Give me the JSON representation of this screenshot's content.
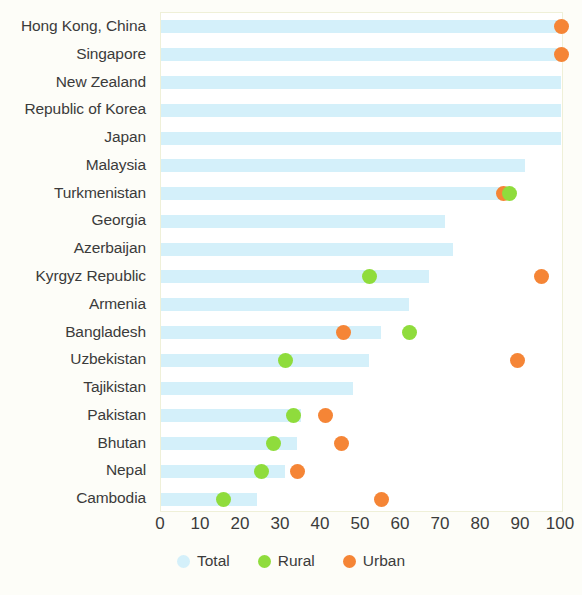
{
  "chart_data": {
    "type": "bar",
    "title": "",
    "subtitle": "",
    "xlabel": "",
    "ylabel": "",
    "xlim": [
      0,
      100
    ],
    "xticks": [
      0,
      10,
      20,
      30,
      40,
      50,
      60,
      70,
      80,
      90,
      100
    ],
    "grid": false,
    "orientation": "horizontal",
    "legend_position": "bottom",
    "categories": [
      "Hong Kong, China",
      "Singapore",
      "New Zealand",
      "Republic of Korea",
      "Japan",
      "Malaysia",
      "Turkmenistan",
      "Georgia",
      "Azerbaijan",
      "Kyrgyz Republic",
      "Armenia",
      "Bangladesh",
      "Uzbekistan",
      "Tajikistan",
      "Pakistan",
      "Bhutan",
      "Nepal",
      "Cambodia"
    ],
    "series": [
      {
        "name": "Total",
        "type": "bar",
        "color": "#d4f0fa",
        "values": [
          100,
          100,
          100,
          100,
          100,
          91,
          86,
          71,
          73,
          67,
          62,
          55,
          52,
          48,
          35,
          34,
          31,
          24
        ]
      },
      {
        "name": "Rural",
        "type": "scatter",
        "color": "#8fdc3c",
        "values": [
          null,
          null,
          null,
          null,
          null,
          null,
          87,
          null,
          null,
          52,
          null,
          62,
          31,
          null,
          33,
          28,
          25,
          15.5
        ]
      },
      {
        "name": "Urban",
        "type": "scatter",
        "color": "#f58536",
        "values": [
          100,
          100,
          null,
          null,
          null,
          null,
          85.5,
          null,
          null,
          95,
          null,
          45.5,
          89,
          null,
          41,
          45,
          34,
          55
        ]
      }
    ]
  },
  "legend": {
    "items": [
      {
        "label": "Total",
        "color": "#d4f0fa",
        "swatch": "total-swatch-icon"
      },
      {
        "label": "Rural",
        "color": "#8fdc3c",
        "swatch": "rural-swatch-icon"
      },
      {
        "label": "Urban",
        "color": "#f58536",
        "swatch": "urban-swatch-icon"
      }
    ]
  }
}
